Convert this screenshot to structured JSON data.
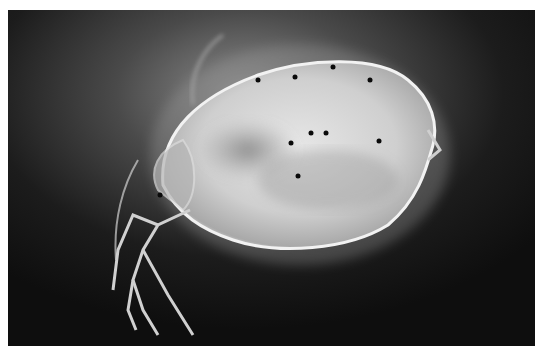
{
  "image": {
    "subject": "water flea (Daphnia) micrograph",
    "style": "grayscale, dark field",
    "colors": {
      "background": "#111111",
      "body": "#d8d8d8",
      "halo": "#8a8a8a",
      "spots": "#0a0a0a",
      "margin": "#ffffff"
    }
  }
}
